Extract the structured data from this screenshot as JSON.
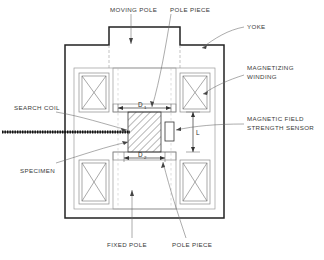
{
  "diagram": {
    "colors": {
      "outline": "#222222",
      "thin_line": "#8a8a8a",
      "label_text": "#3a3a3a",
      "dimension_text": "#2b2b2b",
      "search_coil": "#1a1a1a",
      "leader": "#555555",
      "background": "#ffffff"
    },
    "labels": {
      "moving_pole": "MOVING POLE",
      "pole_piece_top": "POLE PIECE",
      "yoke": "YOKE",
      "magnetizing_winding_line1": "MAGNETIZING",
      "magnetizing_winding_line2": "WINDING",
      "magnetic_field_sensor_line1": "MAGNETIC FIELD",
      "magnetic_field_sensor_line2": "STRENGTH SENSOR",
      "search_coil": "SEARCH COIL",
      "specimen": "SPECIMEN",
      "fixed_pole": "FIXED POLE",
      "pole_piece_bottom": "POLE PIECE"
    },
    "dimensions": {
      "d1_base": "D",
      "d1_sub": "1",
      "d2_base": "D",
      "d2_sub": "2",
      "gap_length": "L"
    }
  }
}
